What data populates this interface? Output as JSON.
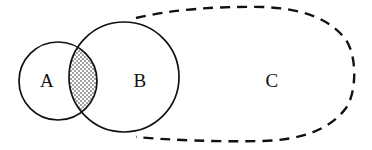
{
  "diagram": {
    "background_color": "#ffffff",
    "stroke_color": "#111111",
    "labels": {
      "a": "A",
      "b": "B",
      "c": "C"
    },
    "shapes": [
      {
        "name": "circle-a",
        "label": "A",
        "type": "circle",
        "style": "solid",
        "cx": 58,
        "cy": 81,
        "r": 39,
        "fill": "none"
      },
      {
        "name": "circle-b",
        "label": "B",
        "type": "circle",
        "style": "solid",
        "cx": 124,
        "cy": 77,
        "r": 55,
        "fill": "none"
      },
      {
        "name": "region-c",
        "label": "C",
        "type": "stadium",
        "style": "dashed",
        "left": 135,
        "right": 357,
        "top": 8,
        "bottom": 139,
        "fill": "none"
      }
    ],
    "intersection": {
      "name": "a-intersect-b",
      "fill_pattern": "stipple-crosshatch",
      "pattern_color": "#111111",
      "shaded": true
    },
    "label_positions": {
      "a": {
        "x": 47,
        "y": 82
      },
      "b": {
        "x": 140,
        "y": 82
      },
      "c": {
        "x": 272,
        "y": 82
      }
    },
    "dash_pattern": "10 7"
  }
}
